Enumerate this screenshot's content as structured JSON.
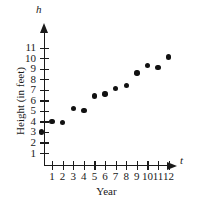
{
  "chart_data": {
    "type": "scatter",
    "title": "",
    "xlabel": "Year",
    "ylabel": "Height (in feet)",
    "x_var_label": "t",
    "y_var_label": "h",
    "xlim": [
      0,
      12.8
    ],
    "ylim": [
      0,
      11.6
    ],
    "grid": false,
    "legend": null,
    "x_ticks": [
      1,
      2,
      3,
      4,
      5,
      6,
      7,
      8,
      9,
      10,
      11,
      12
    ],
    "x_tick_labels": [
      "1",
      "2",
      "3",
      "4",
      "5",
      "6",
      "7",
      "8",
      "9",
      "10",
      "11",
      "12"
    ],
    "y_ticks": [
      1,
      2,
      3,
      4,
      5,
      6,
      7,
      8,
      9,
      10,
      11
    ],
    "y_tick_labels": [
      "1",
      "2",
      "3",
      "4",
      "5",
      "6",
      "7",
      "8",
      "9",
      "10",
      "11"
    ],
    "x": [
      0,
      1,
      2,
      3,
      4,
      5,
      6,
      7,
      8,
      9,
      10,
      11,
      12
    ],
    "values": [
      3,
      4,
      3.9,
      5.2,
      5.05,
      6.4,
      6.6,
      7.1,
      7.4,
      8.6,
      9.3,
      9.1,
      10.1
    ],
    "points": [
      {
        "t": 0,
        "h": 3
      },
      {
        "t": 1,
        "h": 4
      },
      {
        "t": 2,
        "h": 3.9
      },
      {
        "t": 3,
        "h": 5.2
      },
      {
        "t": 4,
        "h": 5.05
      },
      {
        "t": 5,
        "h": 6.4
      },
      {
        "t": 6,
        "h": 6.6
      },
      {
        "t": 7,
        "h": 7.1
      },
      {
        "t": 8,
        "h": 7.4
      },
      {
        "t": 9,
        "h": 8.6
      },
      {
        "t": 10,
        "h": 9.3
      },
      {
        "t": 11,
        "h": 9.1
      },
      {
        "t": 12,
        "h": 10.1
      }
    ],
    "marker_color": "#111111",
    "axis_color": "#1a1a1a"
  }
}
